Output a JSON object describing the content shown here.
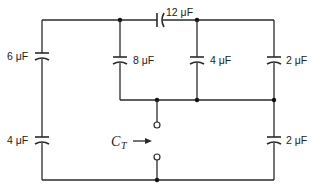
{
  "diagram": {
    "type": "capacitor-network",
    "capacitors": {
      "left_top": {
        "label": "6 μF"
      },
      "left_bottom": {
        "label": "4 μF"
      },
      "series_top": {
        "label": "12 μF"
      },
      "branch_a": {
        "label": "8 μF"
      },
      "branch_b": {
        "label": "4 μF"
      },
      "right_top": {
        "label": "2 μF"
      },
      "right_bottom": {
        "label": "2 μF"
      }
    },
    "terminal_label": {
      "main": "C",
      "sub": "T"
    },
    "colors": {
      "line": "#2a2a2a",
      "background": "#ffffff"
    }
  }
}
